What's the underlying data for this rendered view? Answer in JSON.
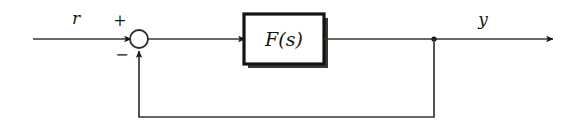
{
  "diagram": {
    "background_color": "#ffffff",
    "line_color": "#3a352f",
    "ink_color": "#1a1714",
    "signals": {
      "input": {
        "label": "r",
        "name": "reference-input-signal"
      },
      "output": {
        "label": "y",
        "name": "output-signal"
      }
    },
    "summing_junction": {
      "name": "summing-junction",
      "shape": "circle",
      "center_x": 139,
      "center_y": 39,
      "radius": 9,
      "positive_sign": "+",
      "negative_sign": "−"
    },
    "blocks": [
      {
        "name": "transfer-function-block",
        "label": "F(s)",
        "label_function": "F",
        "label_argument": "s",
        "x": 244,
        "y": 14,
        "width": 80,
        "height": 50
      }
    ],
    "nodes": [
      {
        "name": "feedback-tap-node",
        "x": 434,
        "y": 39
      }
    ],
    "connections": [
      {
        "name": "input-to-summing-junction",
        "from": "reference-input",
        "to": "summing-junction",
        "arrow": true
      },
      {
        "name": "summing-junction-to-block",
        "from": "summing-junction",
        "to": "transfer-function-block",
        "arrow": true
      },
      {
        "name": "block-to-output",
        "from": "transfer-function-block",
        "to": "output",
        "arrow": true
      },
      {
        "name": "feedback-path",
        "from": "feedback-tap-node",
        "to": "summing-junction",
        "arrow": true
      }
    ]
  }
}
